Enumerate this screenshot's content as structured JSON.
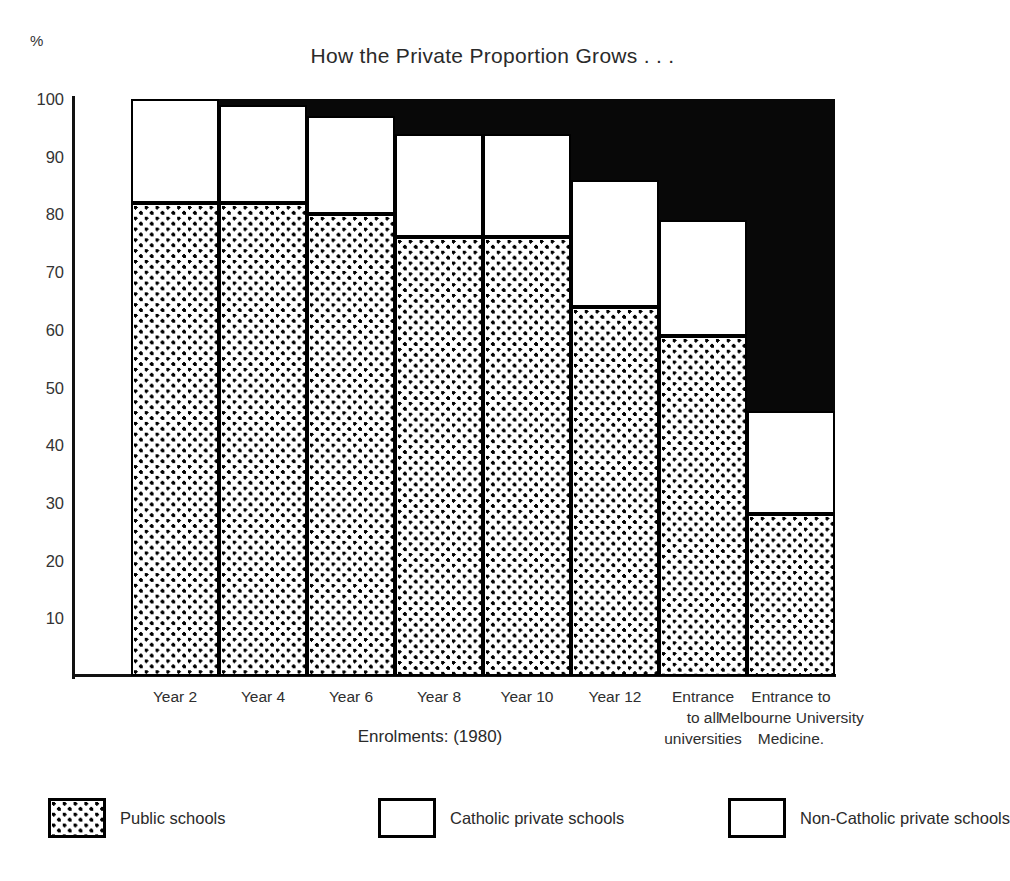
{
  "percent_symbol": "%",
  "x_axis_title": "Enrolments: (1980)",
  "legend": {
    "items": [
      {
        "label": "Public schools",
        "key": "public",
        "color": "#ffffff",
        "pattern": "dotted"
      },
      {
        "label": "Catholic private schools",
        "key": "catholic",
        "color": "#ffffff",
        "pattern": "solid-white"
      },
      {
        "label": "Non-Catholic private schools",
        "key": "noncatholic",
        "color": "#080808",
        "pattern": "solid-black"
      }
    ]
  },
  "chart_data": {
    "type": "bar",
    "stacked": true,
    "stack_total": 100,
    "title": "How the Private Proportion Grows . . .",
    "xlabel": "Enrolments: (1980)",
    "ylabel": "%",
    "ylim": [
      0,
      100
    ],
    "yticks": [
      100,
      90,
      80,
      70,
      60,
      50,
      40,
      30,
      20,
      10
    ],
    "ytick_labels": [
      "100",
      "90",
      "80",
      "70",
      "60",
      "50",
      "40",
      "30",
      "20",
      "10"
    ],
    "grid": false,
    "legend_position": "bottom",
    "categories": [
      "Year 2",
      "Year 4",
      "Year 6",
      "Year 8",
      "Year 10",
      "Year 12",
      "Entrance to all universities",
      "Entrance to Melbourne University Medicine."
    ],
    "category_label_lines": [
      [
        "Year 2"
      ],
      [
        "Year 4"
      ],
      [
        "Year 6"
      ],
      [
        "Year 8"
      ],
      [
        "Year 10"
      ],
      [
        "Year 12"
      ],
      [
        "Entrance",
        "to all",
        "universities"
      ],
      [
        "Entrance to",
        "Melbourne University",
        "Medicine."
      ]
    ],
    "series": [
      {
        "name": "Public schools",
        "color": "#ffffff",
        "pattern": "dotted",
        "values": [
          82,
          82,
          80,
          76,
          76,
          64,
          59,
          28
        ]
      },
      {
        "name": "Catholic private schools",
        "color": "#ffffff",
        "pattern": "solid-white",
        "values": [
          18,
          17,
          17,
          18,
          18,
          22,
          20,
          18
        ]
      },
      {
        "name": "Non-Catholic private schools",
        "color": "#080808",
        "pattern": "solid-black",
        "values": [
          0,
          1,
          3,
          6,
          6,
          14,
          21,
          54
        ]
      }
    ],
    "cumulative_tops": [
      {
        "public": 82,
        "catholic": 100
      },
      {
        "public": 82,
        "catholic": 99
      },
      {
        "public": 80,
        "catholic": 97
      },
      {
        "public": 76,
        "catholic": 94
      },
      {
        "public": 76,
        "catholic": 94
      },
      {
        "public": 64,
        "catholic": 86
      },
      {
        "public": 59,
        "catholic": 79
      },
      {
        "public": 28,
        "catholic": 46
      }
    ]
  }
}
